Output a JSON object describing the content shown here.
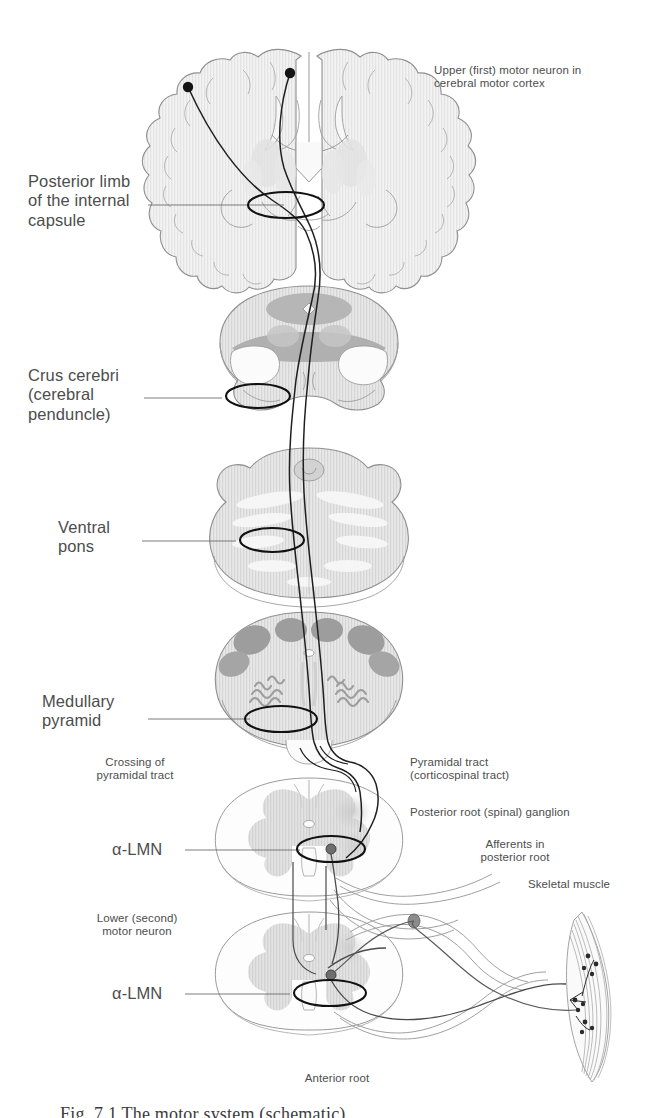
{
  "figure": {
    "caption_partial": "Fig. 7.1   The motor system (schematic)"
  },
  "labels": {
    "upper_motor_neuron": "Upper  (first) motor neuron in\ncerebral motor cortex",
    "internal_capsule": "Posterior limb\nof the internal\ncapsule",
    "crus_cerebri": "Crus cerebri\n(cerebral\npenduncle)",
    "ventral_pons": "Ventral\npons",
    "medullary_pyramid": "Medullary\npyramid",
    "crossing_pyramidal_tract": "Crossing of\npyramidal tract",
    "pyramidal_tract": "Pyramidal tract\n(corticospinal tract)",
    "posterior_root_ganglion": "Posterior root (spinal) ganglion",
    "afferents_posterior_root": "Afferents in\nposterior root",
    "skeletal_muscle": "Skeletal muscle",
    "alpha_lmn_upper": "α-LMN",
    "alpha_lmn_lower": "α-LMN",
    "lower_motor_neuron": "Lower (second)\nmotor neuron",
    "anterior_root": "Anterior root"
  },
  "sections": [
    {
      "name": "cerebral-hemispheres-coronal",
      "label": "Coronal section of cerebrum"
    },
    {
      "name": "midbrain-cross-section",
      "label": "Midbrain"
    },
    {
      "name": "pons-cross-section",
      "label": "Pons"
    },
    {
      "name": "medulla-cross-section",
      "label": "Medulla oblongata"
    },
    {
      "name": "spinal-cord-upper",
      "label": "Spinal cord (cervical)"
    },
    {
      "name": "spinal-cord-lower",
      "label": "Spinal cord (lumbar)"
    }
  ],
  "colors": {
    "outline": "#8a8a8a",
    "tract_line": "#2b2b2b",
    "text": "#4d4d4d",
    "tissue_light": "#ededed",
    "tissue_mid": "#d9d9d9",
    "tissue_dark": "#a8a8a8",
    "nucleus_dark": "#9a9a9a",
    "background": "#ffffff"
  }
}
